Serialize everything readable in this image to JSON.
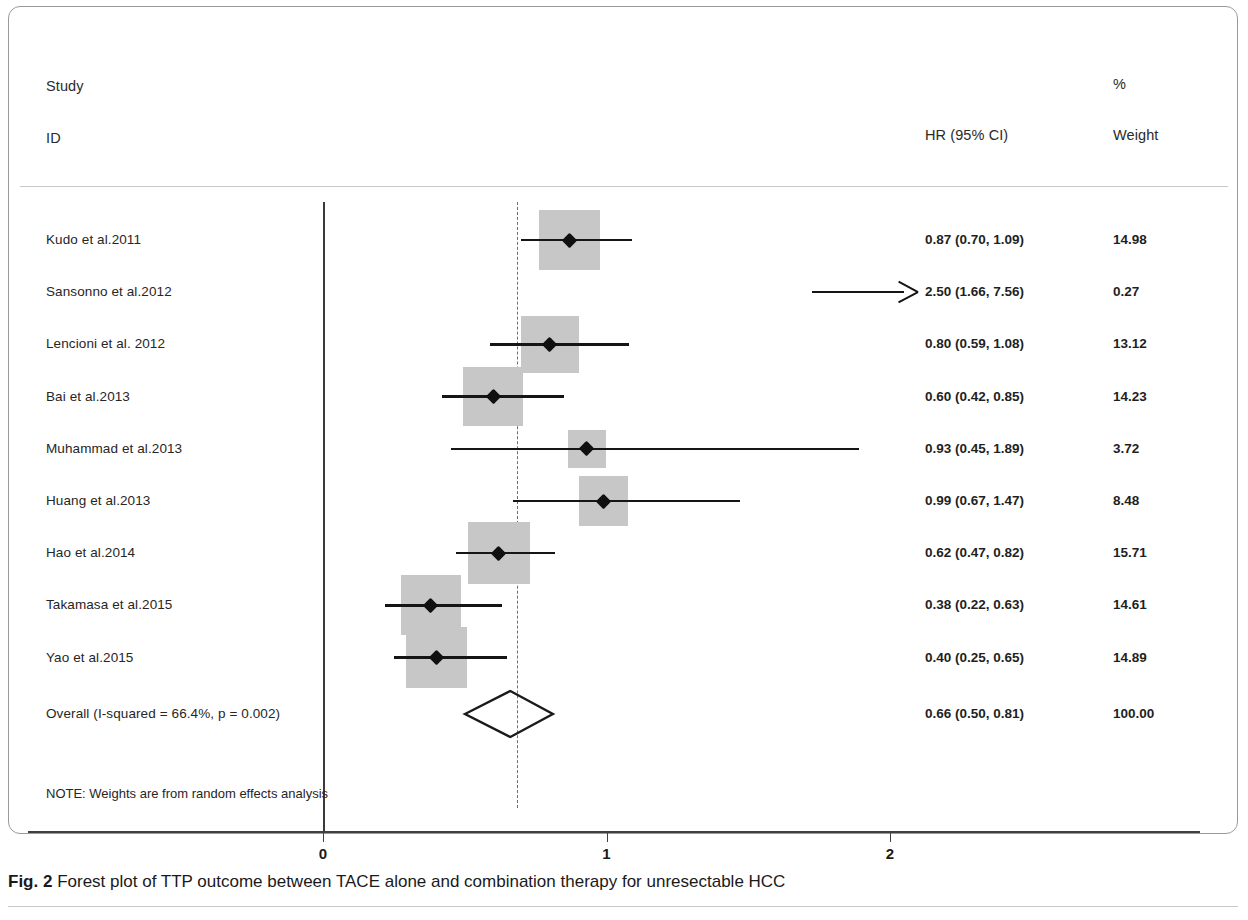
{
  "figure": {
    "caption_prefix": "Fig. 2",
    "caption_text": "Forest plot of TTP outcome between TACE alone and combination therapy for unresectable HCC"
  },
  "headers": {
    "study": "Study",
    "id": "ID",
    "effect": "HR (95% CI)",
    "percent": "%",
    "weight": "Weight"
  },
  "note": "NOTE: Weights are from random effects analysis",
  "colors": {
    "weight_box": "#c7c7c7",
    "line": "#151515",
    "axis": "#3f3f3f",
    "pooled_dash": "#6d6d6d"
  },
  "chart_data": {
    "type": "forest",
    "title": "Forest plot of TTP outcome between TACE alone and combination therapy for unresectable HCC",
    "xlabel": "",
    "ylabel": "",
    "effect_measure": "HR (95% CI)",
    "xticks": [
      0,
      1,
      2
    ],
    "xtick_labels": [
      "0",
      "1",
      "2"
    ],
    "xlim": [
      0,
      2.2
    ],
    "null_line": 0,
    "pooled_reference_line": 0.66,
    "grid": false,
    "legend": "none",
    "heterogeneity": "I-squared = 66.4%, p = 0.002",
    "model": "random effects",
    "rows": [
      {
        "study": "Kudo et al.2011",
        "estimate": 0.87,
        "lower": 0.7,
        "upper": 1.09,
        "effect_label": "0.87 (0.70, 1.09)",
        "weight": 14.98,
        "weight_label": "14.98",
        "clipped": false
      },
      {
        "study": "Sansonno et al.2012",
        "estimate": 2.5,
        "lower": 1.66,
        "upper": 7.56,
        "effect_label": "2.50 (1.66, 7.56)",
        "weight": 0.27,
        "weight_label": "0.27",
        "clipped": true
      },
      {
        "study": "Lencioni et al. 2012",
        "estimate": 0.8,
        "lower": 0.59,
        "upper": 1.08,
        "effect_label": "0.80 (0.59, 1.08)",
        "weight": 13.12,
        "weight_label": "13.12",
        "clipped": false
      },
      {
        "study": "Bai et al.2013",
        "estimate": 0.6,
        "lower": 0.42,
        "upper": 0.85,
        "effect_label": "0.60 (0.42, 0.85)",
        "weight": 14.23,
        "weight_label": "14.23",
        "clipped": false
      },
      {
        "study": "Muhammad et al.2013",
        "estimate": 0.93,
        "lower": 0.45,
        "upper": 1.89,
        "effect_label": "0.93 (0.45, 1.89)",
        "weight": 3.72,
        "weight_label": "3.72",
        "clipped": false
      },
      {
        "study": "Huang et al.2013",
        "estimate": 0.99,
        "lower": 0.67,
        "upper": 1.47,
        "effect_label": "0.99 (0.67, 1.47)",
        "weight": 8.48,
        "weight_label": "8.48",
        "clipped": false
      },
      {
        "study": "Hao et al.2014",
        "estimate": 0.62,
        "lower": 0.47,
        "upper": 0.82,
        "effect_label": "0.62 (0.47, 0.82)",
        "weight": 15.71,
        "weight_label": "15.71",
        "clipped": false
      },
      {
        "study": "Takamasa et al.2015",
        "estimate": 0.38,
        "lower": 0.22,
        "upper": 0.63,
        "effect_label": "0.38 (0.22, 0.63)",
        "weight": 14.61,
        "weight_label": "14.61",
        "clipped": false
      },
      {
        "study": "Yao et al.2015",
        "estimate": 0.4,
        "lower": 0.25,
        "upper": 0.65,
        "effect_label": "0.40 (0.25, 0.65)",
        "weight": 14.89,
        "weight_label": "14.89",
        "clipped": false
      }
    ],
    "overall": {
      "study": "Overall  (I-squared = 66.4%, p = 0.002)",
      "estimate": 0.66,
      "lower": 0.5,
      "upper": 0.81,
      "effect_label": "0.66 (0.50, 0.81)",
      "weight": 100.0,
      "weight_label": "100.00"
    }
  }
}
